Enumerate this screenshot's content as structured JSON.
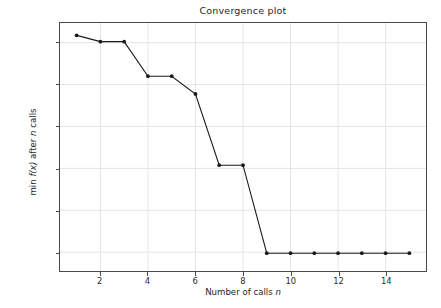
{
  "chart_data": {
    "type": "line",
    "title": "Convergence plot",
    "xlabel": "Number of calls n",
    "ylabel": "min f(x) after n calls",
    "xlabel_plain": "Number of calls ",
    "xlabel_italic": "n",
    "ylabel_part1": "min ",
    "ylabel_italic1": "f(x)",
    "ylabel_part2": " after ",
    "ylabel_italic2": "n",
    "ylabel_part3": " calls",
    "x": [
      1,
      2,
      3,
      4,
      5,
      6,
      7,
      8,
      9,
      10,
      11,
      12,
      13,
      14,
      15
    ],
    "values": [
      0.035,
      0.005,
      0.005,
      -0.16,
      -0.16,
      -0.245,
      -0.585,
      -0.585,
      -1.005,
      -1.005,
      -1.005,
      -1.005,
      -1.005,
      -1.005,
      -1.005
    ],
    "series": [
      {
        "name": "minimum found",
        "values": [
          0.035,
          0.005,
          0.005,
          -0.16,
          -0.16,
          -0.245,
          -0.585,
          -0.585,
          -1.005,
          -1.005,
          -1.005,
          -1.005,
          -1.005,
          -1.005,
          -1.005
        ]
      }
    ],
    "xlim": [
      0.3,
      15.7
    ],
    "ylim": [
      -1.09,
      0.094
    ],
    "xticks": [
      2,
      4,
      6,
      8,
      10,
      12,
      14
    ],
    "xtick_labels": [
      "2",
      "4",
      "6",
      "8",
      "10",
      "12",
      "14"
    ],
    "yticks": [
      0.0,
      -0.2,
      -0.4,
      -0.6,
      -0.8,
      -1.0
    ],
    "ytick_labels": [
      "0.0",
      "−0.2",
      "−0.4",
      "−0.6",
      "−0.8",
      "−1.0"
    ],
    "grid": true,
    "legend": null,
    "line_color": "#1a1a1a",
    "marker": "circle",
    "marker_color": "#1a1a1a",
    "grid_color": "#e4e4e4",
    "axis_color": "#4a4a4a",
    "background": "#ffffff"
  }
}
